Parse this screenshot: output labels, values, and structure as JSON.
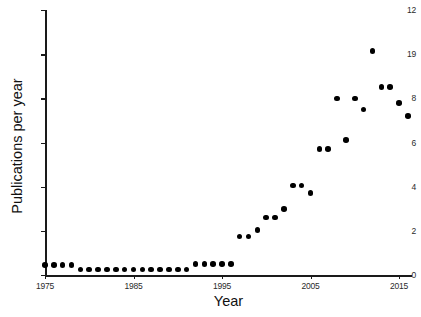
{
  "chart_data": {
    "type": "scatter",
    "title": "",
    "xlabel": "Year",
    "ylabel": "Publications per year",
    "xlim": [
      1975,
      2017
    ],
    "ylim": [
      0,
      12
    ],
    "grid": false,
    "legend": null,
    "marker": {
      "shape": "circle",
      "color": "#000000",
      "size": 5.6
    },
    "xticks": [
      1975,
      1985,
      1995,
      2005,
      2015
    ],
    "xtick_labels": [
      "1975",
      "1985",
      "1995",
      "2005",
      "2015"
    ],
    "yticks": [
      0,
      2,
      4,
      6,
      8,
      10,
      12
    ],
    "ytick_labels": [
      "0",
      "2",
      "4",
      "6",
      "8",
      "19",
      "12"
    ],
    "ytick_labels_note": "The tick drawn at value 10 renders in the source pixels as the glyph '19'.",
    "x": [
      1975,
      1976,
      1977,
      1978,
      1979,
      1980,
      1981,
      1982,
      1983,
      1984,
      1985,
      1986,
      1987,
      1988,
      1989,
      1990,
      1991,
      1992,
      1993,
      1994,
      1995,
      1996,
      1997,
      1998,
      1999,
      2000,
      2001,
      2002,
      2003,
      2004,
      2005,
      2006,
      2007,
      2008,
      2009,
      2010,
      2011,
      2012,
      2013,
      2014,
      2015,
      2016
    ],
    "y": [
      0.45,
      0.45,
      0.45,
      0.45,
      0.25,
      0.25,
      0.25,
      0.25,
      0.25,
      0.25,
      0.25,
      0.25,
      0.25,
      0.25,
      0.25,
      0.25,
      0.25,
      0.5,
      0.5,
      0.5,
      0.5,
      0.5,
      1.75,
      1.75,
      2.05,
      2.6,
      2.6,
      3.0,
      4.05,
      4.05,
      3.7,
      5.7,
      5.7,
      8.0,
      6.1,
      8.0,
      7.5,
      10.15,
      8.5,
      8.5,
      7.8,
      7.2
    ],
    "series_name": "Publications per year",
    "n_points": 42
  }
}
